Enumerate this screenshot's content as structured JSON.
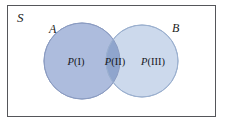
{
  "figure": {
    "type": "venn-diagram",
    "sample_space_label": "S",
    "background_color": "#ffffff",
    "frame_color": "#55565a"
  },
  "sets": {
    "left": {
      "name": "A",
      "label": "A",
      "fill_color": "#adbcdd",
      "stroke_color": "#8b9cc2",
      "cx": 75,
      "cy": 56,
      "r": 38
    },
    "right": {
      "name": "B",
      "label": "B",
      "fill_color": "#ccd9ec",
      "stroke_color": "#9bb0cf",
      "cx": 135,
      "cy": 56,
      "r": 36
    },
    "intersection": {
      "fill_color": "#8fa5cd"
    }
  },
  "regions": [
    {
      "id": "I",
      "symbol": "P",
      "numeral": "(I)",
      "text": "P(I)",
      "description": "A only"
    },
    {
      "id": "II",
      "symbol": "P",
      "numeral": "(II)",
      "text": "P(II)",
      "description": "A intersect B"
    },
    {
      "id": "III",
      "symbol": "P",
      "numeral": "(III)",
      "text": "P(III)",
      "description": "B only"
    }
  ]
}
